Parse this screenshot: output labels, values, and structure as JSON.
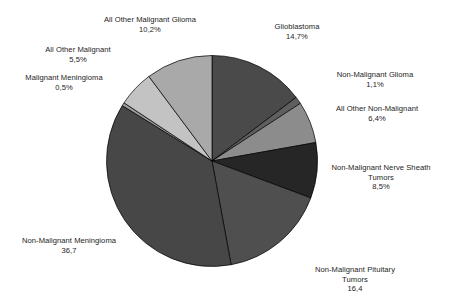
{
  "chart_data": {
    "type": "pie",
    "title": "",
    "subtitle": "",
    "xlabel": "",
    "ylabel": "",
    "legend_position": "none",
    "grid": false,
    "start_angle_deg": 0,
    "direction": "clockwise",
    "decimal_separator": ",",
    "categories": [
      "Glioblastoma",
      "Non-Malignant Glioma",
      "All Other Non-Malignant",
      "Non-Malignant Nerve Sheath Tumors",
      "Non-Malignant Pituitary Tumors",
      "Non-Malignant Meningioma",
      "Malignant Meningioma",
      "All Other Malignant",
      "All Other Malignant Glioma"
    ],
    "values": [
      14.7,
      1.1,
      6.4,
      8.5,
      16.4,
      36.7,
      0.5,
      5.5,
      10.2
    ],
    "value_labels": [
      "14,7%",
      "1,1%",
      "6,4%",
      "8,5%",
      "16,4",
      "36,7",
      "0,5%",
      "5,5%",
      "10,2%"
    ],
    "colors": [
      "#4a4a4a",
      "#5f5f5f",
      "#8c8c8c",
      "#262626",
      "#4f4f4f",
      "#474747",
      "#9a9a9a",
      "#c3c3c3",
      "#a9a9a9"
    ],
    "slice_edge_color": "#000000",
    "background_color": "#ffffff",
    "text_color": "#1c1c1c"
  },
  "labels": {
    "glioblastoma": {
      "name": "Glioblastoma",
      "value": "14,7%"
    },
    "non_malignant_glioma": {
      "name": "Non-Malignant Glioma",
      "value": "1,1%"
    },
    "all_other_non_malignant": {
      "name": "All Other Non-Malignant",
      "value": "6,4%"
    },
    "non_malignant_nerve_sheath": {
      "name_line1": "Non-Malignant Nerve Sheath",
      "name_line2": "Tumors",
      "value": "8,5%"
    },
    "non_malignant_pituitary": {
      "name_line1": "Non-Malignant Pituitary",
      "name_line2": "Tumors",
      "value": "16,4"
    },
    "non_malignant_meningioma": {
      "name": "Non-Malignant Meningioma",
      "value": "36,7"
    },
    "malignant_meningioma": {
      "name": "Malignant Meningioma",
      "value": "0,5%"
    },
    "all_other_malignant": {
      "name": "All Other Malignant",
      "value": "5,5%"
    },
    "all_other_malignant_glioma": {
      "name": "All Other Malignant Glioma",
      "value": "10,2%"
    }
  }
}
